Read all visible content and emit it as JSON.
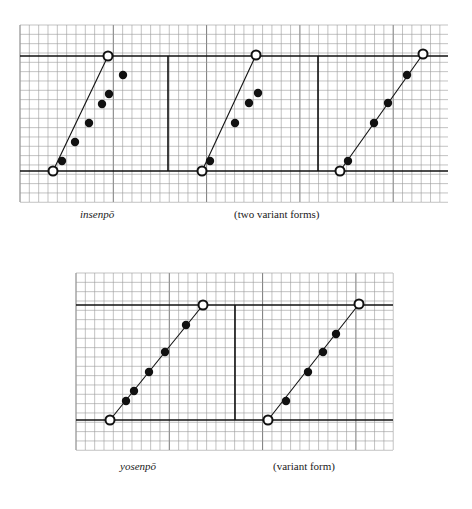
{
  "figure": {
    "top": {
      "label_left": "insenpō",
      "label_right": "(two variant forms)",
      "grid": {
        "x": 20,
        "y": 25,
        "width": 428,
        "height": 177,
        "cell": 9.33
      },
      "rules": {
        "upper_y": 56,
        "lower_y": 171
      },
      "dividers_x": [
        168,
        318
      ],
      "panels": [
        {
          "name": "insenpo-form-1",
          "start": [
            53,
            171
          ],
          "end": [
            108,
            56
          ],
          "dots": [
            [
              62,
              161
            ],
            [
              75,
              142
            ],
            [
              89,
              123
            ],
            [
              102,
              104
            ],
            [
              109,
              94
            ],
            [
              123,
              75
            ]
          ]
        },
        {
          "name": "insenpo-form-2",
          "start": [
            202,
            171
          ],
          "end": [
            256,
            55
          ],
          "dots": [
            [
              210,
              161
            ],
            [
              235,
              123
            ],
            [
              249,
              103
            ],
            [
              258,
              93
            ]
          ]
        },
        {
          "name": "insenpo-form-3",
          "start": [
            340,
            171
          ],
          "end": [
            423,
            54
          ],
          "dots": [
            [
              348,
              161
            ],
            [
              374,
              123
            ],
            [
              388,
              103
            ],
            [
              407,
              75
            ]
          ]
        }
      ]
    },
    "bottom": {
      "label_left": "yosenpō",
      "label_right": "(variant form)",
      "grid": {
        "x": 76,
        "y": 273,
        "width": 317,
        "height": 177,
        "cell": 9.33
      },
      "rules": {
        "upper_y": 305,
        "lower_y": 420
      },
      "dividers_x": [
        235
      ],
      "panels": [
        {
          "name": "yosenpo-form-1",
          "start": [
            110,
            420
          ],
          "end": [
            203,
            305
          ],
          "dots": [
            [
              126,
              401
            ],
            [
              134,
              391
            ],
            [
              149,
              372
            ],
            [
              165,
              352
            ],
            [
              186,
              325
            ]
          ]
        },
        {
          "name": "yosenpo-form-2",
          "start": [
            268,
            420
          ],
          "end": [
            359,
            304
          ],
          "dots": [
            [
              286,
              401
            ],
            [
              308,
              372
            ],
            [
              323,
              352
            ],
            [
              336,
              334
            ]
          ]
        }
      ]
    },
    "colors": {
      "grid_minor": "#9a9a9a",
      "grid_major": "#6a6a6a",
      "rule": "#111111",
      "ink": "#111111"
    }
  }
}
